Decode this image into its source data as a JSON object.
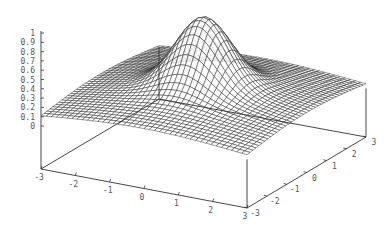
{
  "chart_data": {
    "type": "surface",
    "title": "",
    "xlabel": "",
    "ylabel": "",
    "zlabel": "",
    "x_ticks": [
      "-3",
      "-2",
      "-1",
      "0",
      "1",
      "2",
      "3"
    ],
    "y_ticks": [
      "-3",
      "-2",
      "-1",
      "0",
      "1",
      "2",
      "3"
    ],
    "z_ticks": [
      "0",
      "0.1",
      "0.2",
      "0.3",
      "0.4",
      "0.5",
      "0.6",
      "0.7",
      "0.8",
      "0.9",
      "1"
    ],
    "xlim": [
      -3,
      3
    ],
    "ylim": [
      -3,
      3
    ],
    "zlim": [
      0,
      1
    ],
    "grid_samples": 40,
    "function": "z = 0.7*exp(-(x^2+y^2)) + 0.3*exp(-(x^2+y^2)/18)",
    "peak": {
      "x": 0,
      "y": 0,
      "z": 1.0
    },
    "corner_z": 0.06,
    "style": "hidden3d wireframe mesh",
    "line_color": "#222222",
    "axis_color": "#333333",
    "legend": "none"
  }
}
